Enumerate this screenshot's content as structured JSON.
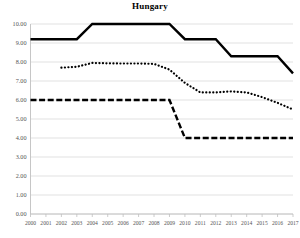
{
  "chart_data": {
    "type": "line",
    "title": "Hungary",
    "xlabel": "",
    "ylabel": "",
    "xlim": [
      2000,
      2017
    ],
    "ylim": [
      0.0,
      10.0
    ],
    "grid": true,
    "legend": "none",
    "y_tick_labels": [
      "10.00",
      "9.00",
      "8.00",
      "7.00",
      "6.00",
      "5.00",
      "4.00",
      "3.00",
      "2.00",
      "1.00",
      "0.00"
    ],
    "y_tick_values": [
      10,
      9,
      8,
      7,
      6,
      5,
      4,
      3,
      2,
      1,
      0
    ],
    "categories": [
      2000,
      2001,
      2002,
      2003,
      2004,
      2005,
      2006,
      2007,
      2008,
      2009,
      2010,
      2011,
      2012,
      2013,
      2014,
      2015,
      2016,
      2017
    ],
    "x_tick_labels": [
      "2000",
      "2001",
      "2002",
      "2003",
      "2004",
      "2005",
      "2006",
      "2007",
      "2008",
      "2009",
      "2010",
      "2011",
      "2012",
      "2013",
      "2014",
      "2015",
      "2016",
      "2017"
    ],
    "series": [
      {
        "name": "solid-series",
        "style": "solid",
        "color": "#000000",
        "width": 2.4,
        "x": [
          2000,
          2001,
          2002,
          2003,
          2004,
          2005,
          2006,
          2007,
          2008,
          2009,
          2010,
          2011,
          2012,
          2013,
          2014,
          2015,
          2016,
          2017
        ],
        "values": [
          9.2,
          9.2,
          9.2,
          9.2,
          10.0,
          10.0,
          10.0,
          10.0,
          10.0,
          10.0,
          9.2,
          9.2,
          9.2,
          8.3,
          8.3,
          8.3,
          8.3,
          7.4
        ]
      },
      {
        "name": "dotted-series",
        "style": "dotted",
        "color": "#000000",
        "width": 2.0,
        "x": [
          2002,
          2003,
          2004,
          2005,
          2006,
          2007,
          2008,
          2009,
          2010,
          2011,
          2012,
          2013,
          2014,
          2015,
          2016,
          2017
        ],
        "values": [
          7.7,
          7.75,
          7.95,
          7.93,
          7.92,
          7.92,
          7.9,
          7.6,
          6.9,
          6.4,
          6.4,
          6.45,
          6.4,
          6.15,
          5.85,
          5.5
        ]
      },
      {
        "name": "dashed-series",
        "style": "dashed",
        "color": "#000000",
        "width": 2.4,
        "x": [
          2000,
          2001,
          2002,
          2003,
          2004,
          2005,
          2006,
          2007,
          2008,
          2009,
          2010,
          2011,
          2012,
          2013,
          2014,
          2015,
          2016,
          2017
        ],
        "values": [
          6.0,
          6.0,
          6.0,
          6.0,
          6.0,
          6.0,
          6.0,
          6.0,
          6.0,
          6.0,
          4.0,
          4.0,
          4.0,
          4.0,
          4.0,
          4.0,
          4.0,
          4.0
        ]
      }
    ],
    "colors": {
      "line": "#000000",
      "grid": "#d9d9d9",
      "axis": "#bfbfbf",
      "tick_text": "#555555"
    }
  }
}
